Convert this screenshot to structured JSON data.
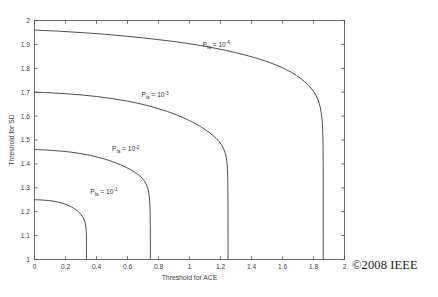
{
  "chart_data": {
    "type": "line",
    "title": "",
    "xlabel": "Threshold for ACE",
    "ylabel": "Threshold for SD",
    "xlim": [
      0,
      2
    ],
    "ylim": [
      1,
      2
    ],
    "grid": false,
    "legend_position": "inline-annotations",
    "xticks": [
      0,
      0.2,
      0.4,
      0.6,
      0.8,
      1,
      1.2,
      1.4,
      1.6,
      1.8,
      2
    ],
    "xticklabels": [
      "0",
      "0.2",
      "0.4",
      "0.6",
      "0.8",
      "1",
      "1.2",
      "1.4",
      "1.6",
      "1.8",
      "2"
    ],
    "yticks": [
      1,
      1.1,
      1.2,
      1.3,
      1.4,
      1.5,
      1.6,
      1.7,
      1.8,
      1.9,
      2
    ],
    "yticklabels": [
      "1",
      "1.1",
      "1.2",
      "1.3",
      "1.4",
      "1.5",
      "1.6",
      "1.7",
      "1.8",
      "1.9",
      "2"
    ],
    "series": [
      {
        "name": "Pfa = 10^-1",
        "label_base": "P",
        "label_sub": "fa",
        "label_eq": " = 10",
        "label_sup": "-1",
        "label_x": 0.36,
        "label_y": 1.275,
        "y_at_zero": 1.25,
        "asymptote_x": 0.335,
        "points": [
          [
            0.0,
            1.25
          ],
          [
            0.03,
            1.2495
          ],
          [
            0.06,
            1.2485
          ],
          [
            0.09,
            1.2468
          ],
          [
            0.12,
            1.2442
          ],
          [
            0.15,
            1.2405
          ],
          [
            0.18,
            1.2355
          ],
          [
            0.21,
            1.2285
          ],
          [
            0.24,
            1.2192
          ],
          [
            0.265,
            1.2095
          ],
          [
            0.285,
            1.1995
          ],
          [
            0.3,
            1.1885
          ],
          [
            0.312,
            1.177
          ],
          [
            0.321,
            1.165
          ],
          [
            0.3275,
            1.151
          ],
          [
            0.3315,
            1.136
          ],
          [
            0.3338,
            1.118
          ],
          [
            0.3348,
            1.098
          ],
          [
            0.3352,
            1.072
          ],
          [
            0.3354,
            1.04
          ],
          [
            0.3355,
            1.0
          ]
        ]
      },
      {
        "name": "Pfa = 10^-2",
        "label_base": "P",
        "label_sub": "fa",
        "label_eq": " = 10",
        "label_sup": "-2",
        "label_x": 0.5,
        "label_y": 1.452,
        "y_at_zero": 1.46,
        "asymptote_x": 0.745,
        "points": [
          [
            0.0,
            1.46
          ],
          [
            0.06,
            1.4585
          ],
          [
            0.12,
            1.4562
          ],
          [
            0.18,
            1.453
          ],
          [
            0.24,
            1.4487
          ],
          [
            0.3,
            1.443
          ],
          [
            0.36,
            1.4355
          ],
          [
            0.42,
            1.4262
          ],
          [
            0.48,
            1.4145
          ],
          [
            0.53,
            1.4028
          ],
          [
            0.58,
            1.389
          ],
          [
            0.625,
            1.374
          ],
          [
            0.665,
            1.357
          ],
          [
            0.695,
            1.34
          ],
          [
            0.715,
            1.322
          ],
          [
            0.729,
            1.302
          ],
          [
            0.7375,
            1.278
          ],
          [
            0.7425,
            1.248
          ],
          [
            0.7452,
            1.212
          ],
          [
            0.7465,
            1.168
          ],
          [
            0.7472,
            1.115
          ],
          [
            0.7475,
            1.06
          ],
          [
            0.7476,
            1.0
          ]
        ]
      },
      {
        "name": "Pfa = 10^-3",
        "label_base": "P",
        "label_sub": "fa",
        "label_eq": " = 10",
        "label_sup": "-3",
        "label_x": 0.69,
        "label_y": 1.678,
        "y_at_zero": 1.7,
        "asymptote_x": 1.245,
        "points": [
          [
            0.0,
            1.7
          ],
          [
            0.1,
            1.6975
          ],
          [
            0.2,
            1.6938
          ],
          [
            0.3,
            1.6888
          ],
          [
            0.4,
            1.682
          ],
          [
            0.5,
            1.6735
          ],
          [
            0.6,
            1.6625
          ],
          [
            0.7,
            1.6488
          ],
          [
            0.8,
            1.631
          ],
          [
            0.88,
            1.6138
          ],
          [
            0.96,
            1.5932
          ],
          [
            1.04,
            1.5678
          ],
          [
            1.1,
            1.5442
          ],
          [
            1.15,
            1.5195
          ],
          [
            1.19,
            1.494
          ],
          [
            1.215,
            1.47
          ],
          [
            1.231,
            1.444
          ],
          [
            1.24,
            1.414
          ],
          [
            1.2445,
            1.378
          ],
          [
            1.2468,
            1.334
          ],
          [
            1.2478,
            1.282
          ],
          [
            1.2483,
            1.22
          ],
          [
            1.2486,
            1.145
          ],
          [
            1.2487,
            1.07
          ],
          [
            1.2488,
            1.0
          ]
        ]
      },
      {
        "name": "Pfa = 10^-4",
        "label_base": "P",
        "label_sub": "fa",
        "label_eq": " = 10",
        "label_sup": "-4",
        "label_x": 1.085,
        "label_y": 1.888,
        "y_at_zero": 1.96,
        "asymptote_x": 1.862,
        "points": [
          [
            0.0,
            1.96
          ],
          [
            0.15,
            1.9555
          ],
          [
            0.3,
            1.9495
          ],
          [
            0.45,
            1.9425
          ],
          [
            0.6,
            1.9338
          ],
          [
            0.75,
            1.9238
          ],
          [
            0.9,
            1.912
          ],
          [
            1.05,
            1.8975
          ],
          [
            1.2,
            1.8795
          ],
          [
            1.32,
            1.862
          ],
          [
            1.44,
            1.8408
          ],
          [
            1.54,
            1.8185
          ],
          [
            1.62,
            1.7958
          ],
          [
            1.69,
            1.77
          ],
          [
            1.745,
            1.743
          ],
          [
            1.788,
            1.714
          ],
          [
            1.818,
            1.684
          ],
          [
            1.8375,
            1.652
          ],
          [
            1.849,
            1.618
          ],
          [
            1.8562,
            1.578
          ],
          [
            1.8598,
            1.532
          ],
          [
            1.8615,
            1.478
          ],
          [
            1.8623,
            1.412
          ],
          [
            1.8627,
            1.332
          ],
          [
            1.8629,
            1.232
          ],
          [
            1.863,
            1.12
          ],
          [
            1.863,
            1.0
          ]
        ]
      }
    ]
  },
  "copyright": {
    "text": "©2008 IEEE"
  }
}
